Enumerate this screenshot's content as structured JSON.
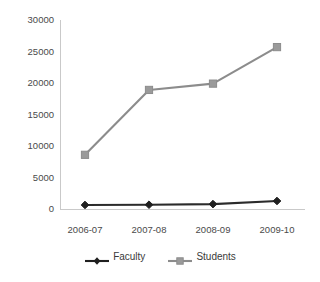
{
  "chart_data": {
    "type": "line",
    "title": "",
    "xlabel": "",
    "ylabel": "",
    "categories": [
      "2006-07",
      "2007-08",
      "2008-09",
      "2009-10"
    ],
    "series": [
      {
        "name": "Faculty",
        "color": "#1f1f1f",
        "marker": "diamond",
        "values": [
          640,
          680,
          780,
          1270
        ]
      },
      {
        "name": "Students",
        "color": "#9a9a9a",
        "marker": "square",
        "values": [
          8600,
          18900,
          19900,
          25700
        ]
      }
    ],
    "ylim": [
      0,
      30000
    ],
    "yticks": [
      0,
      5000,
      10000,
      15000,
      20000,
      25000,
      30000
    ],
    "ytick_labels": [
      "0",
      "5000",
      "10000",
      "15000",
      "20000",
      "25000",
      "30000"
    ],
    "grid": false,
    "legend_position": "bottom-center"
  },
  "legend": {
    "entries": [
      {
        "label": "Faculty"
      },
      {
        "label": "Students"
      }
    ]
  },
  "colors": {
    "faculty": "#1f1f1f",
    "students": "#9a9a9a",
    "axis": "#c9c9c9",
    "text": "#3a3a3a",
    "background": "#ffffff"
  },
  "bottom_bleed": {
    "text": " "
  }
}
